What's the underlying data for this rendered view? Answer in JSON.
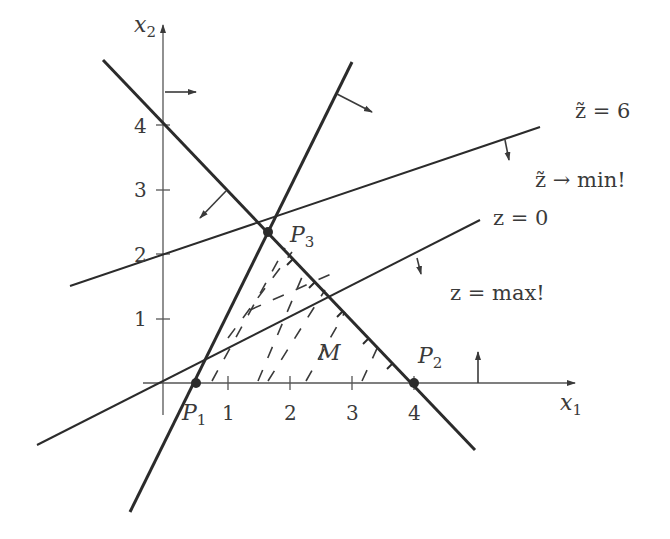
{
  "diagram": {
    "type": "linear-programming-graphical-solution",
    "axes": {
      "x_label": "x",
      "x_sub": "1",
      "y_label": "x",
      "y_sub": "2",
      "x_ticks": [
        "1",
        "2",
        "3",
        "4"
      ],
      "y_ticks": [
        "1",
        "2",
        "3",
        "4"
      ]
    },
    "points": {
      "p1": {
        "label": "P",
        "sub": "1"
      },
      "p2": {
        "label": "P",
        "sub": "2"
      },
      "p3": {
        "label": "P",
        "sub": "3"
      }
    },
    "region_label": "M",
    "objective_lines": {
      "z_tilde": {
        "label": "z̃ = 6",
        "direction": "z̃ → min!"
      },
      "z": {
        "label": "z = 0",
        "direction": "z = max!"
      }
    },
    "colors": {
      "line": "#2b2b2b",
      "axis": "#555555",
      "text": "#3a3a3a",
      "background": "#ffffff"
    }
  }
}
